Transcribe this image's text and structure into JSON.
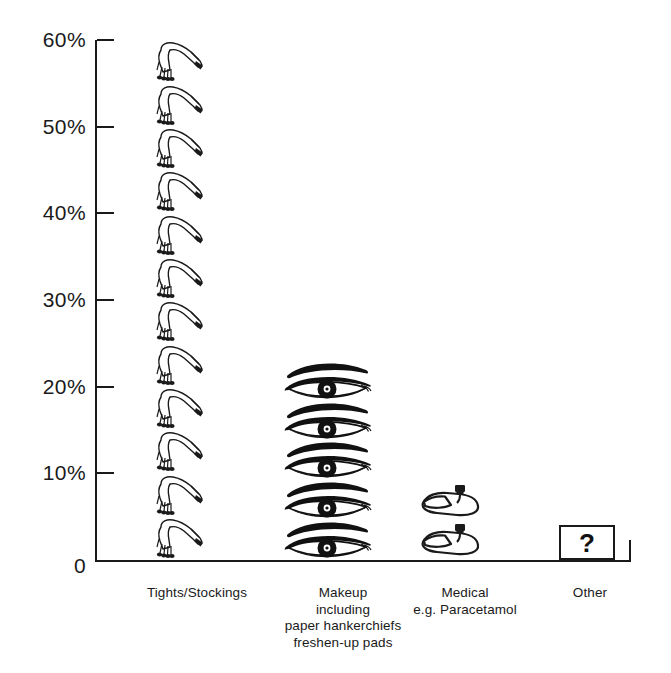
{
  "chart_data": {
    "type": "bar",
    "subtype": "pictogram",
    "title": "",
    "subtitle": "",
    "xlabel": "",
    "ylabel": "",
    "ylim": [
      0,
      60
    ],
    "grid": false,
    "legend": "none",
    "y_tick_labels": [
      "0",
      "10%",
      "20%",
      "30%",
      "40%",
      "50%",
      "60%"
    ],
    "y_tick_values": [
      0,
      10,
      20,
      30,
      40,
      50,
      60
    ],
    "categories": [
      "Tights/Stockings",
      "Makeup including paper hankerchiefs freshen-up pads",
      "Medical e.g. Paracetamol",
      "Other"
    ],
    "values": [
      60,
      23,
      9,
      4
    ],
    "units": "percent",
    "icon_counts": [
      12,
      5,
      2,
      1
    ],
    "icon_names": [
      "tights-legs-icon",
      "eye-makeup-icon",
      "medicine-icon",
      "question-mark-box"
    ],
    "annotations": [
      "?"
    ]
  },
  "axis": {
    "ticks": [
      {
        "label": "60%",
        "value": 60
      },
      {
        "label": "50%",
        "value": 50
      },
      {
        "label": "40%",
        "value": 40
      },
      {
        "label": "30%",
        "value": 30
      },
      {
        "label": "20%",
        "value": 20
      },
      {
        "label": "10%",
        "value": 10
      },
      {
        "label": "0",
        "value": 0
      }
    ]
  },
  "columns": [
    {
      "key": "tights",
      "icon": "tights-legs-icon",
      "count": 12,
      "value": 60,
      "label_lines": [
        "Tights/Stockings"
      ]
    },
    {
      "key": "makeup",
      "icon": "eye-makeup-icon",
      "count": 5,
      "value": 23,
      "label_lines": [
        "Makeup",
        "including",
        "paper hankerchiefs",
        "freshen-up pads"
      ]
    },
    {
      "key": "medical",
      "icon": "medicine-icon",
      "count": 2,
      "value": 9,
      "label_lines": [
        "Medical",
        "e.g. Paracetamol"
      ]
    },
    {
      "key": "other",
      "icon": "question-mark-box",
      "count": 1,
      "value": 4,
      "box_text": "?",
      "label_lines": [
        "Other"
      ]
    }
  ],
  "colors": {
    "background": "#ffffff",
    "ink": "#1a1a1a",
    "icon_fill": "#111111"
  }
}
